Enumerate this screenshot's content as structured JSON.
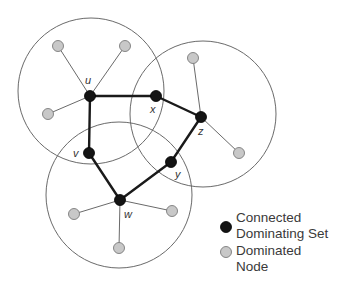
{
  "diagram": {
    "type": "connected-dominating-set-graph",
    "dominating_nodes": [
      {
        "id": "u",
        "label": "u",
        "x": 90,
        "y": 96,
        "lx": 85,
        "ly": 84
      },
      {
        "id": "x",
        "label": "x",
        "x": 156,
        "y": 96,
        "lx": 150,
        "ly": 113
      },
      {
        "id": "z",
        "label": "z",
        "x": 201,
        "y": 117,
        "lx": 198,
        "ly": 135
      },
      {
        "id": "v",
        "label": "v",
        "x": 89,
        "y": 153,
        "lx": 73,
        "ly": 157
      },
      {
        "id": "y",
        "label": "y",
        "x": 171,
        "y": 162,
        "lx": 175,
        "ly": 178
      },
      {
        "id": "w",
        "label": "w",
        "x": 120,
        "y": 200,
        "lx": 124,
        "ly": 218
      }
    ],
    "dominating_edges": [
      [
        "u",
        "x"
      ],
      [
        "x",
        "z"
      ],
      [
        "z",
        "y"
      ],
      [
        "y",
        "w"
      ],
      [
        "w",
        "v"
      ],
      [
        "v",
        "u"
      ]
    ],
    "dominated_nodes": [
      {
        "id": "u1",
        "parent": "u",
        "x": 58,
        "y": 46
      },
      {
        "id": "u2",
        "parent": "u",
        "x": 125,
        "y": 46
      },
      {
        "id": "u3",
        "parent": "u",
        "x": 48,
        "y": 114
      },
      {
        "id": "z1",
        "parent": "z",
        "x": 193,
        "y": 58
      },
      {
        "id": "z2",
        "parent": "z",
        "x": 239,
        "y": 153
      },
      {
        "id": "w1",
        "parent": "w",
        "x": 74,
        "y": 214
      },
      {
        "id": "w2",
        "parent": "w",
        "x": 172,
        "y": 211
      },
      {
        "id": "w3",
        "parent": "w",
        "x": 119,
        "y": 248
      }
    ],
    "coverage_circles": [
      {
        "center": "u",
        "cx": 91,
        "cy": 91,
        "r": 73
      },
      {
        "center": "z",
        "cx": 203,
        "cy": 114,
        "r": 73
      },
      {
        "center": "w",
        "cx": 119,
        "cy": 195,
        "r": 73
      }
    ]
  },
  "legend": {
    "items": [
      {
        "name": "connected-dominating-set",
        "line1": "Connected",
        "line2": "Dominating Set",
        "color": "#141414"
      },
      {
        "name": "dominated-node",
        "line1": "Dominated",
        "line2": "Node",
        "color": "#c8c8c8"
      }
    ]
  }
}
